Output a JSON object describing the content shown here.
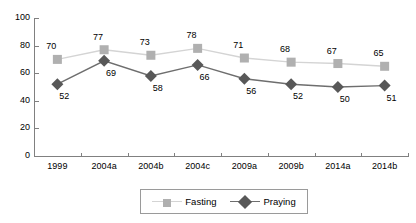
{
  "chart_data": {
    "type": "line",
    "title": "",
    "subtitle": "",
    "xlabel": "",
    "ylabel": "",
    "ylim": [
      0,
      100
    ],
    "yticks": [
      0,
      20,
      40,
      60,
      80,
      100
    ],
    "grid": false,
    "legend_position": "bottom-center",
    "categories": [
      "1999",
      "2004a",
      "2004b",
      "2004c",
      "2009a",
      "2009b",
      "2014a",
      "2014b"
    ],
    "series": [
      {
        "name": "Fasting",
        "marker": "square",
        "color": "#b0b0b0",
        "line_color": "#d4d4d4",
        "label_position": "above",
        "values": [
          70,
          77,
          73,
          78,
          71,
          68,
          67,
          65
        ]
      },
      {
        "name": "Praying",
        "marker": "diamond",
        "color": "#585858",
        "line_color": "#6e6e6e",
        "label_position": "below",
        "values": [
          52,
          69,
          58,
          66,
          56,
          52,
          50,
          51
        ]
      }
    ]
  },
  "legend": {
    "entries": [
      {
        "label": "Fasting"
      },
      {
        "label": "Praying"
      }
    ]
  },
  "axis": {
    "y_tick_labels": [
      "0",
      "20",
      "40",
      "60",
      "80",
      "100"
    ]
  },
  "colors": {
    "axis": "#808080",
    "fasting_marker": "#b0b0b0",
    "fasting_line": "#d4d4d4",
    "praying_marker": "#585858",
    "praying_line": "#6e6e6e",
    "text": "#000000",
    "legend_border": "#9a9a9a",
    "background": "#ffffff"
  }
}
